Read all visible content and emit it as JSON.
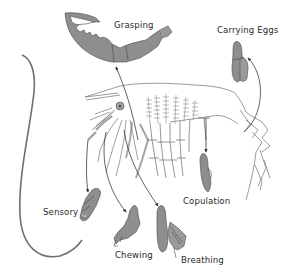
{
  "diagram": {
    "labels": {
      "grasping": "Grasping",
      "carrying_eggs": "Carrying Eggs",
      "copulation": "Copulation",
      "sensory": "Sensory",
      "chewing": "Chewing",
      "breathing": "Breathing"
    },
    "colors": {
      "appendage_fill": "#8e8e8e",
      "appendage_stroke": "#4a4a4a",
      "line": "#3a3a3a",
      "body_line": "#6a6a6a",
      "background": "#ffffff",
      "text": "#2b2b2b"
    }
  }
}
